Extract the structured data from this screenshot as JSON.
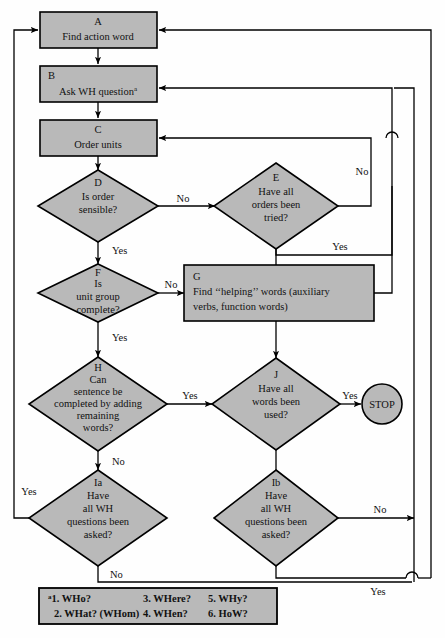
{
  "colors": {
    "node_fill": "#b9b9b9",
    "stroke": "#000000",
    "background": "#ffffff"
  },
  "nodes": {
    "A": {
      "id": "A",
      "shape": "process",
      "lines": [
        "Find action word"
      ]
    },
    "B": {
      "id": "B",
      "shape": "process",
      "lines": [
        "Ask WH question"
      ],
      "superscript": "a"
    },
    "C": {
      "id": "C",
      "shape": "process",
      "lines": [
        "Order units"
      ]
    },
    "D": {
      "id": "D",
      "shape": "decision",
      "lines": [
        "Is order",
        "sensible?"
      ]
    },
    "E": {
      "id": "E",
      "shape": "decision",
      "lines": [
        "Have all",
        "orders been",
        "tried?"
      ]
    },
    "F": {
      "id": "F",
      "shape": "decision",
      "lines": [
        "Is",
        "unit group",
        "complete?"
      ]
    },
    "G": {
      "id": "G",
      "shape": "process",
      "lines": [
        "Find ‘‘helping’’ words (auxiliary",
        "verbs, function words)"
      ]
    },
    "H": {
      "id": "H",
      "shape": "decision",
      "lines": [
        "Can",
        "sentence be",
        "completed by adding",
        "remaining",
        "words?"
      ]
    },
    "J": {
      "id": "J",
      "shape": "decision",
      "lines": [
        "Have all",
        "words been",
        "used?"
      ]
    },
    "Ia": {
      "id": "Ia",
      "shape": "decision",
      "lines": [
        "Have",
        "all WH",
        "questions been",
        "asked?"
      ]
    },
    "Ib": {
      "id": "Ib",
      "shape": "decision",
      "lines": [
        "Have",
        "all WH",
        "questions been",
        "asked?"
      ]
    },
    "STOP": {
      "id": "STOP",
      "shape": "terminal",
      "lines": [
        "STOP"
      ]
    }
  },
  "edge_labels": {
    "d_no": "No",
    "d_yes": "Yes",
    "e_no": "No",
    "e_yes": "Yes",
    "f_no": "No",
    "f_yes": "Yes",
    "h_yes": "Yes",
    "h_no": "No",
    "j_yes": "Yes",
    "ia_yes": "Yes",
    "ia_no": "No",
    "ib_no": "No",
    "ib_yes": "Yes"
  },
  "legend": {
    "marker": "a",
    "items": [
      "1. WHo?",
      "2. WHat? (WHom)",
      "3. WHere?",
      "4. WHen?",
      "5. WHy?",
      "6. HoW?"
    ]
  }
}
